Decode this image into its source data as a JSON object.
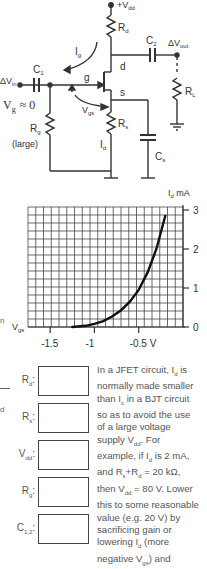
{
  "circuit": {
    "labels": {
      "vdd": "+V",
      "vdd_sub": "dd",
      "rd": "R",
      "rd_sub": "d",
      "c2": "C",
      "c2_sub": "2",
      "dvout": "ΔV",
      "dvout_sub": "out",
      "ig": "I",
      "ig_sub": "g",
      "d": "d",
      "dvin": "ΔV",
      "dvin_sub": "in",
      "c1": "C",
      "c1_sub": "1",
      "g": "g",
      "vg": "V",
      "vg_sub": "g",
      "vg_approx": "≈ 0",
      "s": "s",
      "vgs": "V",
      "vgs_sub": "gs",
      "rl": "R",
      "rl_sub": "L",
      "rg": "R",
      "rg_sub": "g",
      "rg_note": "(large)",
      "rs": "R",
      "rs_sub": "s",
      "id": "I",
      "id_sub": "d",
      "cs": "C",
      "cs_sub": "s"
    }
  },
  "chart_data": {
    "type": "line",
    "title": "",
    "xlabel": "V_gs",
    "ylabel": "I_d mA",
    "x_ticks": [
      "-1.5",
      "-1",
      "-0.5 V"
    ],
    "x_tick_values": [
      -1.5,
      -1.0,
      -0.5
    ],
    "y_ticks": [
      "0",
      "1",
      "2",
      "3"
    ],
    "y_tick_values": [
      0,
      1,
      2,
      3
    ],
    "xlim": [
      -1.75,
      -0.0
    ],
    "ylim": [
      0,
      3
    ],
    "grid": true,
    "series": [
      {
        "name": "I_d vs V_gs",
        "x": [
          -1.25,
          -1.1,
          -1.0,
          -0.9,
          -0.8,
          -0.7,
          -0.6,
          -0.5,
          -0.4,
          -0.3,
          -0.2
        ],
        "values": [
          0.0,
          0.03,
          0.08,
          0.15,
          0.27,
          0.43,
          0.65,
          0.95,
          1.4,
          2.0,
          2.85
        ]
      }
    ]
  },
  "fields": [
    {
      "label": "R",
      "sub": "d",
      "suffix": ":",
      "value": ""
    },
    {
      "label": "R",
      "sub": "s",
      "suffix": ":",
      "value": ""
    },
    {
      "label": "V",
      "sub": "dd",
      "suffix": ":",
      "value": ""
    },
    {
      "label": "R",
      "sub": "g",
      "suffix": ":",
      "value": ""
    },
    {
      "label": "C",
      "sub": "1,2",
      "suffix": ":",
      "value": ""
    }
  ],
  "side_marks": {
    "n": "n",
    "d": "d"
  },
  "note": {
    "text": "In a JFET circuit, I_d is normally made smaller than I_c in a BJT circuit so as to avoid the use of a large voltage supply V_dd. For example, if I_d is 2 mA, and R_s+R_d = 20 kΩ, then V_dd = 80 V. Lower this to some reasonable value (e.g. 20 V) by sacrificing gain or lowering I_d (more negative V_gs) and",
    "lines": [
      [
        "In a JFET circuit, I",
        "d",
        " is"
      ],
      [
        "normally made smaller"
      ],
      [
        "than I",
        "c",
        " in  a BJT circuit"
      ],
      [
        "so as to avoid the use"
      ],
      [
        "of a large voltage"
      ],
      [
        "supply V",
        "dd",
        ". For"
      ],
      [
        "example, if I",
        "d",
        " is 2 mA,"
      ],
      [
        "and R",
        "s",
        "+R",
        "d",
        " = 20 kΩ,"
      ],
      [
        "then V",
        "dd",
        " = 80 V. Lower"
      ],
      [
        "this to some reasonable"
      ],
      [
        "value (e.g. 20 V) by"
      ],
      [
        "sacrificing gain or"
      ],
      [
        "lowering I",
        "d",
        " (more"
      ],
      [
        "negative V",
        "gs",
        ") and"
      ]
    ]
  }
}
